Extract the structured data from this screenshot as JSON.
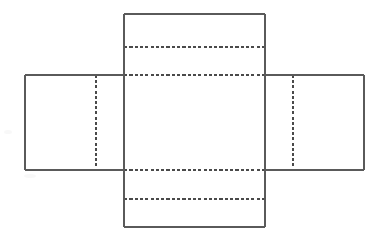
{
  "figure": {
    "kind": "box-net-diagram",
    "canvas": {
      "width": 386,
      "height": 241,
      "background": "#ffffff"
    },
    "colors": {
      "solid_edge": "#5a5a5a",
      "fold_line": "#4a4a4a",
      "panel_fill": "#ffffff",
      "smudge": "#f2f2f2"
    },
    "geometry": {
      "body": {
        "x1": 124,
        "y1": 75,
        "x2": 265,
        "y2": 170
      },
      "left_panel": {
        "x1": 25,
        "y1": 75,
        "x2": 124,
        "y2": 170
      },
      "right_panel": {
        "x1": 265,
        "y1": 75,
        "x2": 364,
        "y2": 170
      },
      "top_flap": {
        "x1": 124,
        "y1": 14,
        "x2": 265,
        "y2": 75
      },
      "bottom_flap": {
        "x1": 124,
        "y1": 170,
        "x2": 265,
        "y2": 227
      }
    },
    "solid_edges": [
      {
        "name": "top-flap-left-edge",
        "x1": 124,
        "y1": 14,
        "x2": 124,
        "y2": 75
      },
      {
        "name": "top-flap-top-edge",
        "x1": 124,
        "y1": 14,
        "x2": 265,
        "y2": 14
      },
      {
        "name": "top-flap-right-edge",
        "x1": 265,
        "y1": 14,
        "x2": 265,
        "y2": 75
      },
      {
        "name": "left-panel-top-edge",
        "x1": 25,
        "y1": 75,
        "x2": 124,
        "y2": 75
      },
      {
        "name": "left-panel-left-edge",
        "x1": 25,
        "y1": 75,
        "x2": 25,
        "y2": 170
      },
      {
        "name": "left-panel-bottom-edge",
        "x1": 25,
        "y1": 170,
        "x2": 124,
        "y2": 170
      },
      {
        "name": "right-panel-top-edge",
        "x1": 265,
        "y1": 75,
        "x2": 364,
        "y2": 75
      },
      {
        "name": "right-panel-right-edge",
        "x1": 364,
        "y1": 75,
        "x2": 364,
        "y2": 170
      },
      {
        "name": "right-panel-bottom-edge",
        "x1": 265,
        "y1": 170,
        "x2": 364,
        "y2": 170
      },
      {
        "name": "body-left-edge",
        "x1": 124,
        "y1": 75,
        "x2": 124,
        "y2": 170
      },
      {
        "name": "body-right-edge",
        "x1": 265,
        "y1": 75,
        "x2": 265,
        "y2": 170
      },
      {
        "name": "bottom-flap-left-edge",
        "x1": 124,
        "y1": 170,
        "x2": 124,
        "y2": 227
      },
      {
        "name": "bottom-flap-bottom-edge",
        "x1": 124,
        "y1": 227,
        "x2": 265,
        "y2": 227
      },
      {
        "name": "bottom-flap-right-edge",
        "x1": 265,
        "y1": 170,
        "x2": 265,
        "y2": 227
      }
    ],
    "fold_lines_horizontal": [
      {
        "name": "top-flap-fold",
        "x1": 124,
        "y": 47,
        "x2": 265
      },
      {
        "name": "body-top-fold",
        "x1": 124,
        "y": 75,
        "x2": 265
      },
      {
        "name": "body-bottom-fold",
        "x1": 124,
        "y": 170,
        "x2": 265
      },
      {
        "name": "bottom-flap-fold",
        "x1": 124,
        "y": 199,
        "x2": 265
      }
    ],
    "fold_lines_vertical": [
      {
        "name": "left-panel-fold",
        "x": 96,
        "y1": 75,
        "y2": 170
      },
      {
        "name": "body-left-fold",
        "x": 124,
        "y1": 75,
        "y2": 170
      },
      {
        "name": "body-right-fold",
        "x": 265,
        "y1": 75,
        "y2": 170
      },
      {
        "name": "right-panel-fold",
        "x": 293,
        "y1": 75,
        "y2": 170
      }
    ],
    "scan_artifacts": [
      {
        "cx": 40,
        "cy": 134,
        "rx": 7,
        "ry": 2.5
      },
      {
        "cx": 57,
        "cy": 132,
        "rx": 5,
        "ry": 2.5
      },
      {
        "cx": 72,
        "cy": 133,
        "rx": 4,
        "ry": 2
      },
      {
        "cx": 88,
        "cy": 131,
        "rx": 3,
        "ry": 2
      },
      {
        "cx": 137,
        "cy": 133,
        "rx": 6,
        "ry": 2.5
      },
      {
        "cx": 156,
        "cy": 133,
        "rx": 4,
        "ry": 2
      },
      {
        "cx": 8,
        "cy": 132,
        "rx": 4,
        "ry": 2
      },
      {
        "cx": 204,
        "cy": 205,
        "rx": 5,
        "ry": 2
      },
      {
        "cx": 30,
        "cy": 176,
        "rx": 6,
        "ry": 2
      }
    ]
  }
}
